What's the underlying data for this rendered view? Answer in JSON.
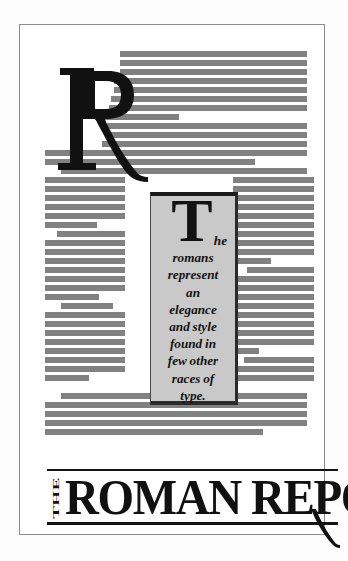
{
  "document": {
    "kind": "type-specimen-page",
    "title": "THE ROMAN REPORT",
    "masthead": {
      "prefix": "THE",
      "main": "ROMAN REPORT"
    },
    "dropcap": "R",
    "pullquote": {
      "dropcap": "T",
      "first_line_remainder": "he",
      "lines": [
        "romans",
        "represent",
        "an",
        "elegance",
        "and style",
        "found in",
        "few other",
        "races of",
        "type."
      ],
      "full_text": "The romans represent an elegance and style found in few other races of type."
    },
    "colors": {
      "page_background": "#ffffff",
      "page_border": "#8c8c8c",
      "text_bar_gray": "#818181",
      "pullquote_fill": "#c9c9c9",
      "pullquote_border": "#1a1a1a",
      "ink": "#111111"
    },
    "greeked_text": {
      "note": "body copy rendered as solid gray bars (simulated text lines)",
      "full_width_top": [
        {
          "x": 119,
          "y": 50,
          "w": 187
        },
        {
          "x": 119,
          "y": 59,
          "w": 187
        },
        {
          "x": 119,
          "y": 68,
          "w": 187
        },
        {
          "x": 113,
          "y": 77,
          "w": 193
        },
        {
          "x": 113,
          "y": 86,
          "w": 193
        },
        {
          "x": 110,
          "y": 95,
          "w": 196
        },
        {
          "x": 108,
          "y": 104,
          "w": 198
        },
        {
          "x": 94,
          "y": 113,
          "w": 84
        },
        {
          "x": 106,
          "y": 122,
          "w": 200
        },
        {
          "x": 104,
          "y": 131,
          "w": 202
        },
        {
          "x": 101,
          "y": 140,
          "w": 205
        },
        {
          "x": 44,
          "y": 149,
          "w": 262
        },
        {
          "x": 44,
          "y": 158,
          "w": 210
        },
        {
          "x": 60,
          "y": 167,
          "w": 194
        }
      ],
      "left_column": [
        {
          "y": 176,
          "w": 80,
          "indent": 0
        },
        {
          "y": 185,
          "w": 80,
          "indent": 0
        },
        {
          "y": 194,
          "w": 80,
          "indent": 0
        },
        {
          "y": 203,
          "w": 80,
          "indent": 0
        },
        {
          "y": 212,
          "w": 80,
          "indent": 0
        },
        {
          "y": 221,
          "w": 52,
          "indent": 0
        },
        {
          "y": 230,
          "w": 68,
          "indent": 12
        },
        {
          "y": 239,
          "w": 80,
          "indent": 0
        },
        {
          "y": 248,
          "w": 80,
          "indent": 0
        },
        {
          "y": 257,
          "w": 80,
          "indent": 0
        },
        {
          "y": 266,
          "w": 80,
          "indent": 0
        },
        {
          "y": 275,
          "w": 80,
          "indent": 0
        },
        {
          "y": 284,
          "w": 80,
          "indent": 0
        },
        {
          "y": 293,
          "w": 54,
          "indent": 0
        },
        {
          "y": 302,
          "w": 52,
          "indent": 16
        },
        {
          "y": 311,
          "w": 80,
          "indent": 0
        },
        {
          "y": 320,
          "w": 80,
          "indent": 0
        },
        {
          "y": 329,
          "w": 80,
          "indent": 0
        },
        {
          "y": 338,
          "w": 80,
          "indent": 0
        },
        {
          "y": 347,
          "w": 80,
          "indent": 0
        },
        {
          "y": 356,
          "w": 80,
          "indent": 0
        },
        {
          "y": 365,
          "w": 80,
          "indent": 0
        },
        {
          "y": 374,
          "w": 44,
          "indent": 0
        }
      ],
      "right_column": [
        {
          "y": 167,
          "w": 74,
          "indent": 0
        },
        {
          "y": 176,
          "w": 81,
          "indent": 0
        },
        {
          "y": 185,
          "w": 81,
          "indent": 0
        },
        {
          "y": 194,
          "w": 81,
          "indent": 0
        },
        {
          "y": 203,
          "w": 81,
          "indent": 0
        },
        {
          "y": 212,
          "w": 81,
          "indent": 0
        },
        {
          "y": 221,
          "w": 81,
          "indent": 0
        },
        {
          "y": 230,
          "w": 81,
          "indent": 0
        },
        {
          "y": 239,
          "w": 81,
          "indent": 0
        },
        {
          "y": 248,
          "w": 81,
          "indent": 0
        },
        {
          "y": 257,
          "w": 38,
          "indent": 0
        },
        {
          "y": 266,
          "w": 67,
          "indent": 14
        },
        {
          "y": 275,
          "w": 81,
          "indent": 0
        },
        {
          "y": 284,
          "w": 81,
          "indent": 0
        },
        {
          "y": 293,
          "w": 81,
          "indent": 0
        },
        {
          "y": 302,
          "w": 81,
          "indent": 0
        },
        {
          "y": 311,
          "w": 81,
          "indent": 0
        },
        {
          "y": 320,
          "w": 81,
          "indent": 0
        },
        {
          "y": 329,
          "w": 81,
          "indent": 0
        },
        {
          "y": 338,
          "w": 81,
          "indent": 0
        },
        {
          "y": 347,
          "w": 26,
          "indent": 0
        },
        {
          "y": 356,
          "w": 70,
          "indent": 11
        },
        {
          "y": 365,
          "w": 81,
          "indent": 0
        },
        {
          "y": 374,
          "w": 81,
          "indent": 0
        }
      ],
      "full_width_bottom": [
        {
          "x": 60,
          "y": 392,
          "w": 246
        },
        {
          "x": 44,
          "y": 401,
          "w": 262
        },
        {
          "x": 44,
          "y": 410,
          "w": 262
        },
        {
          "x": 44,
          "y": 419,
          "w": 262
        },
        {
          "x": 44,
          "y": 428,
          "w": 218
        }
      ]
    }
  }
}
